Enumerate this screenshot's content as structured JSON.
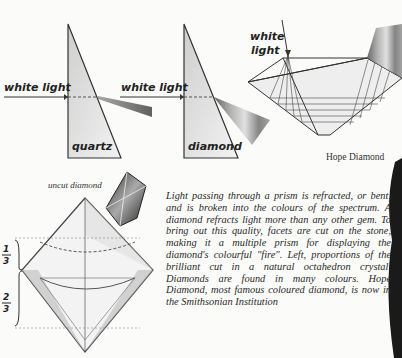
{
  "figures": {
    "prism_quartz": {
      "input_label": "white light",
      "prism_label": "quartz"
    },
    "prism_diamond": {
      "input_label": "white light",
      "prism_label": "diamond"
    },
    "hope_diamond": {
      "input_label_line1": "white",
      "input_label_line2": "light",
      "caption": "Hope Diamond"
    },
    "octahedron": {
      "caption": "uncut diamond",
      "fraction_top": "1/3",
      "fraction_bottom": "2/3",
      "fraction_top_num": "1",
      "fraction_top_den": "3",
      "fraction_bottom_num": "2",
      "fraction_bottom_den": "3"
    }
  },
  "body_text": "Light passing through a prism is refracted, or bent, and is broken into the colours of the spectrum. A diamond refracts light more than any other gem. To bring out this quality, facets are cut on the stone, making it a multiple prism for displaying the diamond's colourful \"fire\". Left, proportions of the brilliant cut in a natural octahedron crystal. Diamonds are found in many colours. Hope Diamond, most famous coloured diamond, is now in the Smithsonian Institution"
}
